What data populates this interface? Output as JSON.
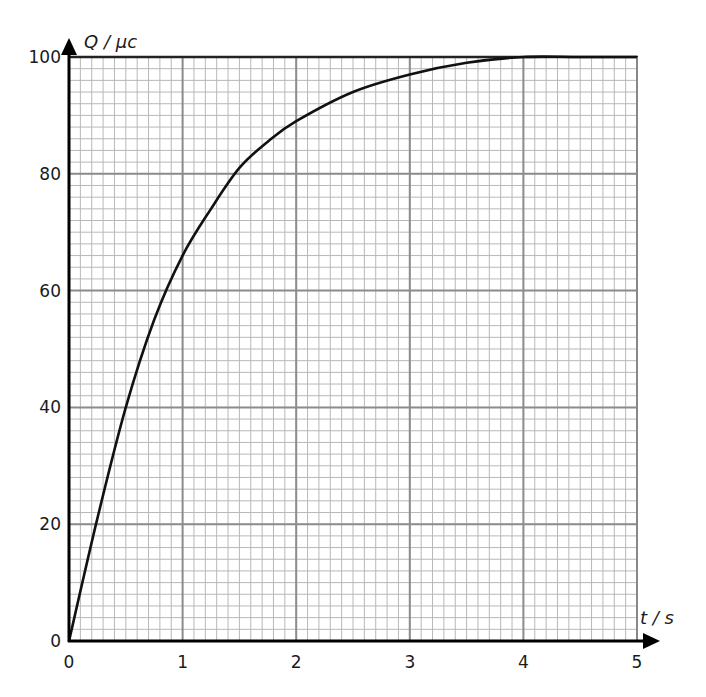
{
  "chart_data": {
    "type": "line",
    "title": "",
    "xlabel": "t / s",
    "ylabel": "Q / μc",
    "xlim": [
      0,
      5
    ],
    "ylim": [
      0,
      100
    ],
    "x_ticks": [
      "0",
      "1",
      "2",
      "3",
      "4",
      "5"
    ],
    "y_ticks": [
      "0",
      "20",
      "40",
      "60",
      "80",
      "100"
    ],
    "grid": {
      "on": true,
      "major_x": 1,
      "minor_x": 0.1,
      "major_y": 20,
      "minor_y": 2
    },
    "legend": null,
    "series": [
      {
        "name": "Q(t)",
        "x": [
          0,
          0.25,
          0.5,
          0.75,
          1.0,
          1.25,
          1.5,
          1.75,
          2.0,
          2.5,
          3.0,
          3.5,
          4.0,
          4.5,
          5.0
        ],
        "y": [
          0,
          21,
          40,
          55,
          66,
          74,
          81,
          85.5,
          89,
          94,
          97,
          99,
          100,
          100,
          100
        ]
      }
    ]
  },
  "colors": {
    "curve": "#111111",
    "axis": "#000000",
    "grid_major": "#8c8c8c",
    "grid_minor": "#b8b8b8"
  }
}
